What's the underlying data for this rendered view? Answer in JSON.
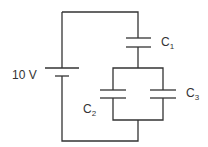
{
  "diagram": {
    "type": "circuit",
    "battery": {
      "label": "10 V"
    },
    "capacitors": [
      {
        "id": "C1",
        "name": "C",
        "sub": "1",
        "connection": "series"
      },
      {
        "id": "C2",
        "name": "C",
        "sub": "2",
        "connection": "parallel with C3"
      },
      {
        "id": "C3",
        "name": "C",
        "sub": "3",
        "connection": "parallel with C2"
      }
    ],
    "colors": {
      "wire": "#333333",
      "background": "#ffffff"
    }
  }
}
